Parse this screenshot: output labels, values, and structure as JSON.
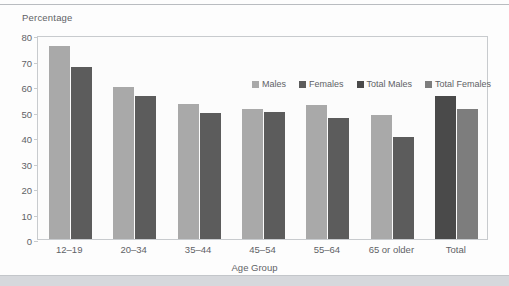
{
  "chart_data": {
    "type": "bar",
    "title": "",
    "subtitle": "",
    "xlabel": "Age Group",
    "ylabel": "Percentage",
    "ylim": [
      0,
      80
    ],
    "yticks": [
      0,
      10,
      20,
      30,
      40,
      50,
      60,
      70,
      80
    ],
    "grid": false,
    "legend_position": "top-right-inside",
    "categories": [
      "12–19",
      "20–34",
      "35–44",
      "45–54",
      "55–64",
      "65 or older",
      "Total"
    ],
    "series": [
      {
        "name": "Males",
        "color": "#a9a9a9",
        "values": [
          75.5,
          59.5,
          53.0,
          51.0,
          52.5,
          48.5,
          null
        ]
      },
      {
        "name": "Females",
        "color": "#5c5c5c",
        "values": [
          67.5,
          56.0,
          49.5,
          50.0,
          47.5,
          40.0,
          null
        ]
      },
      {
        "name": "Total Males",
        "color": "#4a4a4a",
        "values": [
          null,
          null,
          null,
          null,
          null,
          null,
          56.0
        ]
      },
      {
        "name": "Total Females",
        "color": "#7d7d7d",
        "values": [
          null,
          null,
          null,
          null,
          null,
          null,
          51.0
        ]
      }
    ]
  },
  "legend": {
    "items": [
      {
        "label": "Males",
        "color": "#a9a9a9"
      },
      {
        "label": "Females",
        "color": "#5c5c5c"
      },
      {
        "label": "Total Males",
        "color": "#4a4a4a"
      },
      {
        "label": "Total Females",
        "color": "#7d7d7d"
      }
    ]
  },
  "axes": {
    "y_title": "Percentage",
    "x_title": "Age Group",
    "y_tick_labels": [
      "80",
      "70",
      "60",
      "50",
      "40",
      "30",
      "20",
      "10",
      "0"
    ],
    "x_tick_labels": [
      "12–19",
      "20–34",
      "35–44",
      "45–54",
      "55–64",
      "65 or older",
      "Total"
    ]
  },
  "colors": {
    "axis_text": "#5f6266",
    "frame": "#c8cbce",
    "plot_background": "#fcfcfc",
    "page_background": "#fdfdfd",
    "footer_band": "#d6d8dc"
  }
}
